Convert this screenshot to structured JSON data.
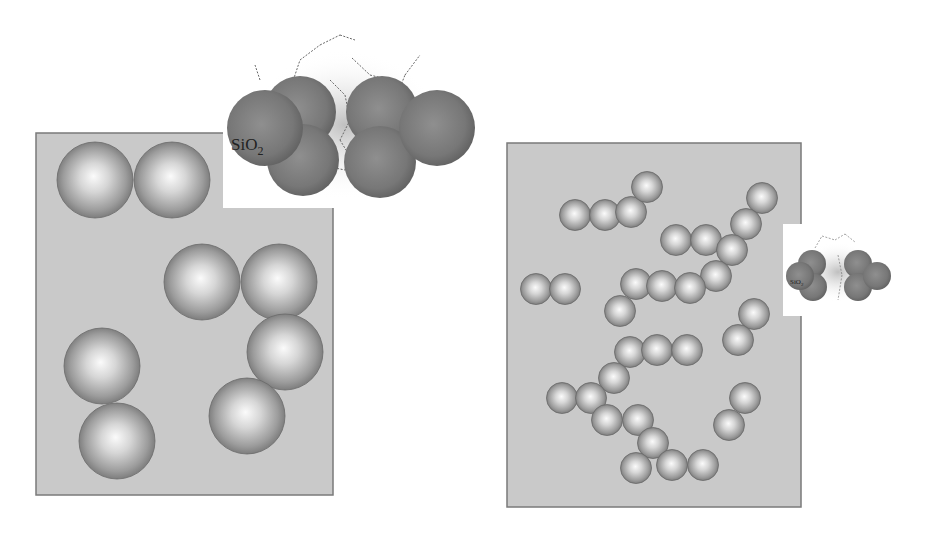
{
  "figure": {
    "panels": [
      {
        "id": "left",
        "description": "Large silica particles dispersed in matrix",
        "particle_count": 8,
        "inset_label": "SiO",
        "inset_label_subscript": "2"
      },
      {
        "id": "right",
        "description": "Small silica particles forming chain-like aggregates",
        "particle_count": 32,
        "inset_label": "SiO",
        "inset_label_subscript": "2"
      }
    ],
    "colors": {
      "matrix_fill": "#c9c9c9",
      "matrix_border": "#7a7a7a",
      "particle_highlight": "#f4f4f4",
      "particle_shadow": "#6e6e6e",
      "aggregate_dark": "#6a6a6a",
      "aggregate_light": "#9a9a9a",
      "halo": "#bdbdbd",
      "bond_line": "#555555"
    }
  }
}
